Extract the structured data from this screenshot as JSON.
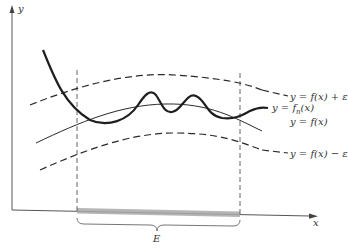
{
  "diagram": {
    "type": "uniform-convergence-epsilon-band",
    "axes": {
      "x_label": "x",
      "y_label": "y"
    },
    "curves": [
      {
        "id": "upper",
        "label": "y = f(x) + ε",
        "style": "dashed"
      },
      {
        "id": "fn",
        "label_prefix": "y = f",
        "label_sub": "n",
        "label_suffix": "(x)",
        "style": "bold"
      },
      {
        "id": "f",
        "label": "y = f(x)",
        "style": "solid"
      },
      {
        "id": "lower",
        "label": "y = f(x) − ε",
        "style": "dashed"
      }
    ],
    "set_label": "E",
    "colors": {
      "line": "#2a2a2a",
      "axis": "#555555",
      "band": "#9a9a9a",
      "text": "#333333"
    }
  }
}
